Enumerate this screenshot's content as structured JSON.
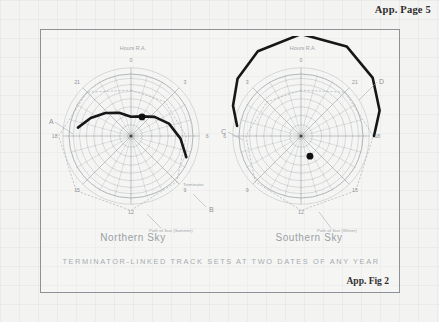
{
  "page": {
    "header_label": "App. Page 5",
    "figure_number": "App. Fig 2",
    "caption": "TERMINATOR-LINKED TRACK SETS AT TWO DATES OF ANY YEAR"
  },
  "charts": [
    {
      "id": "northern",
      "title": "Northern Sky",
      "axis_label": "Hours R.A.",
      "sun_path_label": "Path of Sun (Summer)",
      "terminator_label": "Terminator",
      "hour_ticks": [
        "0",
        "3",
        "6",
        "9",
        "12",
        "15",
        "18",
        "21"
      ],
      "endpoint_labels": [
        {
          "name": "A",
          "text": "A"
        },
        {
          "name": "B",
          "text": "B"
        }
      ],
      "sun_marker_label": "Sun"
    },
    {
      "id": "southern",
      "title": "Southern Sky",
      "axis_label": "Hours R.A.",
      "sun_path_label": "Path of Sun (Winter)",
      "terminator_label": "",
      "hour_ticks": [
        "0",
        "3",
        "6",
        "9",
        "12",
        "15",
        "18",
        "21"
      ],
      "endpoint_labels": [
        {
          "name": "C",
          "text": "C"
        },
        {
          "name": "D",
          "text": "D"
        }
      ],
      "sun_marker_label": "Sun"
    }
  ],
  "chart_data": {
    "type": "scatter",
    "title": "TERMINATOR-LINKED TRACK SETS AT TWO DATES OF ANY YEAR",
    "subtitle": "App. Fig 2",
    "projection": "polar",
    "grid": true,
    "legend_position": "none",
    "xlabel": "Hours R.A.",
    "ylabel": "Declination",
    "panels": [
      {
        "name": "Northern Sky",
        "radial_axis": {
          "label": "Hours R.A.",
          "ticks": [
            0,
            3,
            6,
            9,
            12,
            15,
            18,
            21
          ],
          "tick_labels": [
            "0",
            "3",
            "6",
            "9",
            "12",
            "15",
            "18",
            "21"
          ],
          "range": [
            0,
            24
          ]
        },
        "declination_rings": [
          80,
          70,
          60,
          50,
          40,
          30,
          20,
          10,
          0
        ],
        "annotations": [
          {
            "text": "A",
            "position": "left-outer",
            "ra_hours": 18.6,
            "dec": 8
          },
          {
            "text": "B",
            "position": "lower-right-outer",
            "ra_hours": 7.6,
            "dec": -4
          },
          {
            "text": "Terminator",
            "position": "lower-right-inner",
            "ra_hours": 7.2,
            "dec": 14
          },
          {
            "text": "Path of Sun (Summer)",
            "position": "bottom",
            "ra_hours": 12.6,
            "dec": -10
          },
          {
            "text": "Sun",
            "position": "upper-right",
            "ra_hours": 2.0,
            "dec": 56
          }
        ],
        "series": [
          {
            "name": "Terminator great circle",
            "style": "thick-solid",
            "color": "#171717",
            "points_ra_dec": [
              [
                18.6,
                12
              ],
              [
                19.6,
                26
              ],
              [
                20.8,
                40
              ],
              [
                22.2,
                52
              ],
              [
                0.0,
                62
              ],
              [
                1.8,
                58
              ],
              [
                3.4,
                46
              ],
              [
                4.8,
                32
              ],
              [
                6.2,
                18
              ],
              [
                7.4,
                4
              ]
            ]
          },
          {
            "name": "Path of Sun (Summer)",
            "style": "thin-dashed",
            "color": "#8b9094",
            "points_ra_dec": [
              [
                0,
                23.4
              ],
              [
                3,
                20.0
              ],
              [
                6,
                10.0
              ],
              [
                9,
                -4.0
              ],
              [
                12,
                -18.0
              ],
              [
                15,
                -22.5
              ],
              [
                18,
                -15.0
              ],
              [
                21,
                0.0
              ]
            ]
          }
        ],
        "sun_marker": {
          "ra_hours": 2.0,
          "dec": 58,
          "color": "#101010",
          "radius_px": 4
        }
      },
      {
        "name": "Southern Sky",
        "radial_axis": {
          "label": "Hours R.A.",
          "ticks": [
            0,
            3,
            6,
            9,
            12,
            15,
            18,
            21
          ],
          "tick_labels": [
            "0",
            "3",
            "6",
            "9",
            "12",
            "15",
            "18",
            "21"
          ],
          "range": [
            0,
            24
          ]
        },
        "declination_rings": [
          -80,
          -70,
          -60,
          -50,
          -40,
          -30,
          -20,
          -10,
          0
        ],
        "annotations": [
          {
            "text": "C",
            "position": "left-outer",
            "ra_hours": 5.4,
            "dec": 6
          },
          {
            "text": "D",
            "position": "upper-right-outer",
            "ra_hours": 22.4,
            "dec": 30
          },
          {
            "text": "Path of Sun (Winter)",
            "position": "bottom",
            "ra_hours": 11.6,
            "dec": -12
          },
          {
            "text": "Sun",
            "position": "lower-right",
            "ra_hours": 14.0,
            "dec": -56
          }
        ],
        "series": [
          {
            "name": "Terminator great circle",
            "style": "thick-solid",
            "color": "#171717",
            "points_ra_dec": [
              [
                5.4,
                4
              ],
              [
                4.4,
                18
              ],
              [
                3.2,
                34
              ],
              [
                1.8,
                48
              ],
              [
                0.0,
                58
              ],
              [
                22.2,
                56
              ],
              [
                20.6,
                44
              ],
              [
                19.2,
                30
              ],
              [
                18.0,
                16
              ]
            ]
          },
          {
            "name": "Path of Sun (Winter)",
            "style": "thin-dashed",
            "color": "#8b9094",
            "points_ra_dec": [
              [
                0,
                -23.4
              ],
              [
                3,
                -20.0
              ],
              [
                6,
                -10.0
              ],
              [
                9,
                4.0
              ],
              [
                12,
                18.0
              ],
              [
                15,
                22.5
              ],
              [
                18,
                15.0
              ],
              [
                21,
                0.0
              ]
            ]
          }
        ],
        "sun_marker": {
          "ra_hours": 13.6,
          "dec": -58,
          "color": "#101010",
          "radius_px": 4
        }
      }
    ]
  }
}
